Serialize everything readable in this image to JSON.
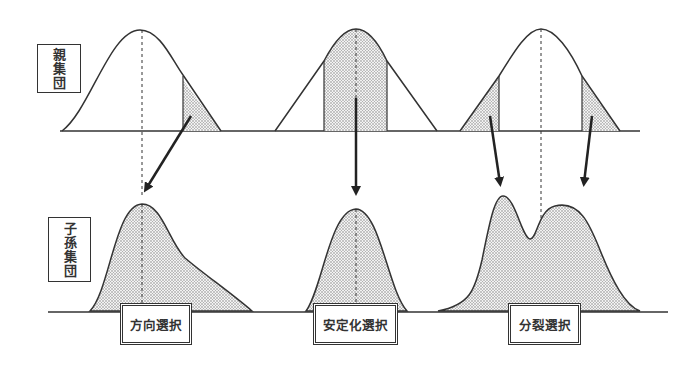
{
  "labels": {
    "parent_population": "親集団",
    "offspring_population": "子孫集団"
  },
  "selection_types": [
    {
      "name": "方向選択",
      "description_shape": "parent normal curve with right tail shaded; offspring skewed curve shifted"
    },
    {
      "name": "安定化選択",
      "description_shape": "parent normal curve with center shaded; offspring narrower peak"
    },
    {
      "name": "分裂選択",
      "description_shape": "parent normal curve with both tails shaded; offspring bimodal curve"
    }
  ],
  "colors": {
    "line": "#333333",
    "fill_dots": "#999999",
    "background": "#ffffff"
  }
}
